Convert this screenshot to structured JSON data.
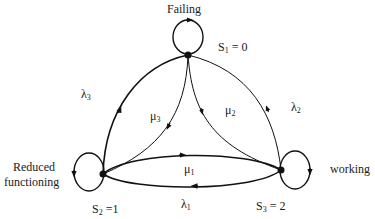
{
  "diagram": {
    "type": "state-transition",
    "nodes": [
      {
        "id": "S1",
        "state_label": "S1 = 0",
        "name": "Failing"
      },
      {
        "id": "S2",
        "state_label": "S2 =1",
        "name": "Reduced functioning"
      },
      {
        "id": "S3",
        "state_label": "S3 = 2",
        "name": "working"
      }
    ],
    "edges": [
      {
        "from": "S2",
        "to": "S1",
        "label": "λ3"
      },
      {
        "from": "S1",
        "to": "S2",
        "label": "μ3"
      },
      {
        "from": "S1",
        "to": "S3",
        "label": "μ2"
      },
      {
        "from": "S3",
        "to": "S1",
        "label": "λ2"
      },
      {
        "from": "S2",
        "to": "S3",
        "label": "μ1"
      },
      {
        "from": "S3",
        "to": "S2",
        "label": "λ1"
      },
      {
        "from": "S1",
        "to": "S1",
        "label": ""
      },
      {
        "from": "S2",
        "to": "S2",
        "label": ""
      },
      {
        "from": "S3",
        "to": "S3",
        "label": ""
      }
    ]
  },
  "labels": {
    "failing": "Failing",
    "s1": {
      "main": "S",
      "sub": "1",
      "rest": " = 0"
    },
    "s2": {
      "main": "S",
      "sub": "2",
      "rest": " =1"
    },
    "s3": {
      "main": "S",
      "sub": "3",
      "rest": " = 2"
    },
    "reduced_line1": "Reduced",
    "reduced_line2": "functioning",
    "working": "working",
    "lambda1": {
      "main": "λ",
      "sub": "1"
    },
    "lambda2": {
      "main": "λ",
      "sub": "2"
    },
    "lambda3": {
      "main": "λ",
      "sub": "3"
    },
    "mu1": {
      "main": "μ",
      "sub": "1"
    },
    "mu2": {
      "main": "μ",
      "sub": "2"
    },
    "mu3": {
      "main": "μ",
      "sub": "3"
    }
  },
  "colors": {
    "stroke": "#111111",
    "background": "#ffffff"
  }
}
